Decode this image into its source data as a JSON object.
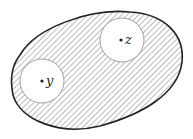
{
  "diagram": {
    "type": "region-with-holes",
    "region": {
      "fill_style": "diagonal-hatch",
      "stroke_color": "#222222",
      "hatch_color": "#777777"
    },
    "holes": [
      {
        "id": "z",
        "label": "z",
        "cx": 122,
        "cy": 40,
        "r": 22
      },
      {
        "id": "y",
        "label": "y",
        "cx": 42,
        "cy": 81,
        "r": 22
      }
    ],
    "points": [
      {
        "label": "z",
        "x": 121,
        "y": 40
      },
      {
        "label": "y",
        "x": 42,
        "y": 81
      }
    ]
  }
}
